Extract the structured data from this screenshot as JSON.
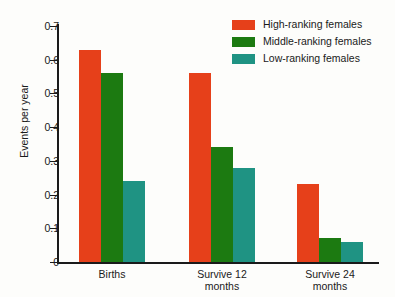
{
  "chart_data": {
    "type": "bar",
    "title": "",
    "xlabel": "",
    "ylabel": "Events per year",
    "ylim": [
      0,
      0.7
    ],
    "yticks": [
      "0",
      "0.1",
      "0.2",
      "0.3",
      "0.4",
      "0.5",
      "0.6",
      "0.7"
    ],
    "grid": false,
    "legend_position": "top-right",
    "categories": [
      "Births",
      "Survive 12 months",
      "Survive 24 months"
    ],
    "category_lines": [
      [
        "Births"
      ],
      [
        "Survive 12",
        "months"
      ],
      [
        "Survive 24",
        "months"
      ]
    ],
    "series": [
      {
        "name": "High-ranking females",
        "color": "#e6401a",
        "values": [
          0.63,
          0.56,
          0.23
        ]
      },
      {
        "name": "Middle-ranking females",
        "color": "#1c7a11",
        "values": [
          0.56,
          0.34,
          0.07
        ]
      },
      {
        "name": "Low-ranking females",
        "color": "#1f9383",
        "values": [
          0.24,
          0.28,
          0.06
        ]
      }
    ]
  },
  "axis": {
    "y_title": "Events per year",
    "y_tick_labels": [
      "0.7",
      "0.6",
      "0.5",
      "0.4",
      "0.3",
      "0.2",
      "0.1",
      "0"
    ],
    "y_tick_values": [
      0.7,
      0.6,
      0.5,
      0.4,
      0.3,
      0.2,
      0.1,
      0
    ]
  },
  "legend": {
    "items": [
      {
        "label": "High-ranking females",
        "color": "#e6401a"
      },
      {
        "label": "Middle-ranking females",
        "color": "#1c7a11"
      },
      {
        "label": "Low-ranking females",
        "color": "#1f9383"
      }
    ]
  }
}
